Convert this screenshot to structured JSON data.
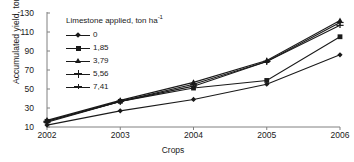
{
  "chart_data": {
    "type": "line",
    "title": "",
    "xlabel": "Crops",
    "ylabel": "Accumulated yield, ton ha",
    "ylabel_sup": "-1",
    "legend_title": "Limestone applied, ton ha",
    "legend_title_sup": "-1",
    "legend_position": "top-left-inside",
    "grid": false,
    "categories": [
      "2002",
      "2003",
      "2004",
      "2005",
      "2006"
    ],
    "x": [
      2002,
      2003,
      2004,
      2005,
      2006
    ],
    "xlim": [
      2002,
      2006
    ],
    "ylim": [
      10,
      130
    ],
    "yticks": [
      130,
      110,
      90,
      70,
      50,
      30,
      10
    ],
    "xticks": [
      "2002",
      "2003",
      "2004",
      "2005",
      "2006"
    ],
    "series": [
      {
        "name": "0",
        "marker": "diamond",
        "values": [
          12,
          27,
          39,
          55,
          86
        ]
      },
      {
        "name": "1,85",
        "marker": "square",
        "values": [
          16,
          37,
          51,
          59,
          105
        ]
      },
      {
        "name": "3,79",
        "marker": "triangle",
        "values": [
          17,
          38,
          57,
          80,
          122
        ]
      },
      {
        "name": "5,56",
        "marker": "cross",
        "values": [
          16,
          37,
          55,
          79,
          120
        ]
      },
      {
        "name": "7,41",
        "marker": "dash",
        "values": [
          15,
          37,
          53,
          79,
          117
        ]
      }
    ],
    "colors": {
      "line": "#1a1a1a",
      "axis": "#808080",
      "background": "#ffffff"
    }
  }
}
